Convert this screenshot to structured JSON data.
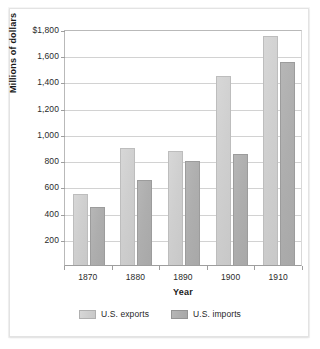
{
  "chart_data": {
    "type": "bar",
    "title": "",
    "xlabel": "Year",
    "ylabel": "Millions of dollars",
    "categories": [
      "1870",
      "1880",
      "1890",
      "1900",
      "1910"
    ],
    "series": [
      {
        "name": "U.S. exports",
        "color": "#cfcfcf",
        "values": [
          545,
          895,
          870,
          1445,
          1745
        ]
      },
      {
        "name": "U.S. imports",
        "color": "#aeaeae",
        "values": [
          445,
          645,
          795,
          845,
          1545
        ]
      }
    ],
    "ylim": [
      0,
      1800
    ],
    "ytick_values": [
      1800,
      1600,
      1400,
      1200,
      1000,
      800,
      600,
      400,
      200
    ],
    "ytick_labels": [
      "$1,800",
      "1,600",
      "1,400",
      "1,200",
      "1,000",
      "800",
      "600",
      "400",
      "200"
    ],
    "grid": true,
    "legend_position": "bottom"
  },
  "legend": {
    "items": [
      {
        "label": "U.S. exports"
      },
      {
        "label": "U.S. imports"
      }
    ]
  }
}
